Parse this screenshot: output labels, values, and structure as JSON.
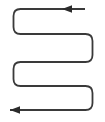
{
  "diagram": {
    "name": "serpentine-scan-path",
    "type": "boustrophedon-path",
    "title": "",
    "caption": "",
    "canvas": {
      "width": 105,
      "height": 122,
      "background": "#ffffff"
    },
    "style": {
      "line_color": "#3a3a3a",
      "line_width": 1.8,
      "corner_radius": 7,
      "arrow_color": "#2b2b2b"
    },
    "geometry": {
      "left_x": 13.5,
      "right_x": 92.5,
      "top_tail_x": 85,
      "bottom_tail_x": 92.5,
      "rows_y": [
        9,
        34,
        62,
        86,
        110
      ],
      "row_count": 5,
      "turns": [
        {
          "side": "left",
          "between_rows": [
            0,
            1
          ]
        },
        {
          "side": "right",
          "between_rows": [
            1,
            2
          ]
        },
        {
          "side": "left",
          "between_rows": [
            2,
            3
          ]
        },
        {
          "side": "right",
          "between_rows": [
            3,
            4
          ]
        }
      ]
    },
    "arrows": [
      {
        "id": "top-arrow",
        "label": "",
        "direction": "left",
        "tip_x": 62,
        "base_x": 72,
        "y": 9
      },
      {
        "id": "bottom-arrow",
        "label": "",
        "direction": "left",
        "tip_x": 10,
        "base_x": 20,
        "y": 110
      }
    ],
    "path_d": "M 85 9 L 20.5 9 Q 13.5 9 13.5 16 L 13.5 27 Q 13.5 34 20.5 34 L 85.5 34 Q 92.5 34 92.5 41 L 92.5 55 Q 92.5 62 85.5 62 L 20.5 62 Q 13.5 62 13.5 69 L 13.5 79 Q 13.5 86 20.5 86 L 85.5 86 Q 92.5 86 92.5 93 L 92.5 103 Q 92.5 110 85.5 110 L 10 110",
    "arrow_top_points": "62,9 72,5.2 72,12.8",
    "arrow_bottom_points": "10,110 20,106.2 20,113.8"
  }
}
